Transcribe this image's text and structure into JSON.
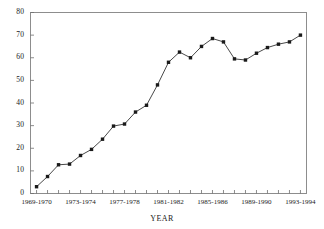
{
  "chart_data": {
    "type": "line",
    "title": "",
    "xlabel": "YEAR",
    "ylabel": "",
    "ylim": [
      0,
      80
    ],
    "ytick_values": [
      0,
      10,
      20,
      30,
      40,
      50,
      60,
      70,
      80
    ],
    "ytick_labels": [
      "0",
      "10",
      "20",
      "30",
      "40",
      "50",
      "60",
      "70",
      "80"
    ],
    "grid": false,
    "legend": "none",
    "marker": "filled-square",
    "line_color": "#1a1a1a",
    "marker_color": "#1a1a1a",
    "categories": [
      "1969-1970",
      "1970-1971",
      "1971-1972",
      "1972-1973",
      "1973-1974",
      "1974-1975",
      "1975-1976",
      "1976-1977",
      "1977-1978",
      "1978-1979",
      "1979-1980",
      "1980-1981",
      "1981-1982",
      "1982-1983",
      "1983-1984",
      "1984-1985",
      "1985-1986",
      "1986-1987",
      "1987-1988",
      "1988-1989",
      "1989-1990",
      "1990-1991",
      "1991-1992",
      "1992-1993",
      "1993-1994"
    ],
    "xtick_labels_shown": [
      {
        "index": 0,
        "label": "1969-1970"
      },
      {
        "index": 4,
        "label": "1973-1974"
      },
      {
        "index": 8,
        "label": "1977-1978"
      },
      {
        "index": 12,
        "label": "1981-1982"
      },
      {
        "index": 16,
        "label": "1985-1986"
      },
      {
        "index": 20,
        "label": "1989-1990"
      },
      {
        "index": 24,
        "label": "1993-1994"
      }
    ],
    "values": [
      3,
      7.5,
      12.7,
      13,
      16.8,
      19.5,
      24,
      29.8,
      30.7,
      36,
      39,
      48,
      58,
      62.5,
      60,
      65,
      68.5,
      67,
      59.5,
      59,
      62,
      64.5,
      66,
      67,
      70
    ]
  }
}
